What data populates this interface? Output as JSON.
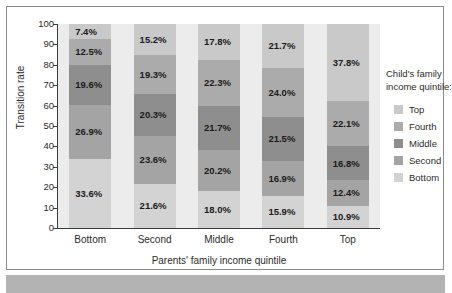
{
  "chart_data": {
    "type": "bar",
    "subtype": "stacked-100-percent",
    "title": "",
    "xlabel": "Parents' family income quintile",
    "ylabel": "Transition rate",
    "categories": [
      "Bottom",
      "Second",
      "Middle",
      "Fourth",
      "Top"
    ],
    "ylim": [
      0,
      100
    ],
    "yticks": [
      0,
      10,
      20,
      30,
      40,
      50,
      60,
      70,
      80,
      90,
      100
    ],
    "grid": false,
    "legend_position": "right",
    "legend_title": "Child's family income quintile:",
    "stack_order_top_to_bottom": [
      "Top",
      "Fourth",
      "Middle",
      "Second",
      "Bottom"
    ],
    "series": [
      {
        "name": "Top",
        "color": "#c9c9c9",
        "values": [
          7.4,
          15.2,
          17.8,
          21.7,
          37.8
        ],
        "labels": [
          "7.4%",
          "15.2%",
          "17.8%",
          "21.7%",
          "37.8%"
        ]
      },
      {
        "name": "Fourth",
        "color": "#ababab",
        "values": [
          12.5,
          19.3,
          22.3,
          24.0,
          22.1
        ],
        "labels": [
          "12.5%",
          "19.3%",
          "22.3%",
          "24.0%",
          "22.1%"
        ]
      },
      {
        "name": "Middle",
        "color": "#8e8e8e",
        "values": [
          19.6,
          20.3,
          21.7,
          21.5,
          16.8
        ],
        "labels": [
          "19.6%",
          "20.3%",
          "21.7%",
          "21.5%",
          "16.8%"
        ]
      },
      {
        "name": "Second",
        "color": "#a4a4a4",
        "values": [
          26.9,
          23.6,
          20.2,
          16.9,
          12.4
        ],
        "labels": [
          "26.9%",
          "23.6%",
          "20.2%",
          "16.9%",
          "12.4%"
        ]
      },
      {
        "name": "Bottom",
        "color": "#d3d3d3",
        "values": [
          33.6,
          21.6,
          18.0,
          15.9,
          10.9
        ],
        "labels": [
          "33.6%",
          "21.6%",
          "18.0%",
          "15.9%",
          "10.9%"
        ]
      }
    ]
  },
  "legend": {
    "title_line1": "Child's family",
    "title_line2": "income quintile:",
    "items": [
      {
        "label": "Top",
        "color": "#c9c9c9"
      },
      {
        "label": "Fourth",
        "color": "#ababab"
      },
      {
        "label": "Middle",
        "color": "#8e8e8e"
      },
      {
        "label": "Second",
        "color": "#a4a4a4"
      },
      {
        "label": "Bottom",
        "color": "#d3d3d3"
      }
    ]
  },
  "axes": {
    "y_title": "Transition rate",
    "x_title": "Parents' family income quintile",
    "y_ticks": [
      "100",
      "90",
      "80",
      "70",
      "60",
      "50",
      "40",
      "30",
      "20",
      "10",
      "0"
    ],
    "x_ticks": [
      "Bottom",
      "Second",
      "Middle",
      "Fourth",
      "Top"
    ]
  }
}
